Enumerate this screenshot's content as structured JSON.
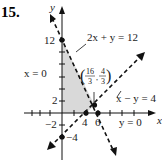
{
  "problem_number": "15.",
  "axes": {
    "x_label": "x",
    "y_label": "y",
    "y_ticks": [
      "12",
      "2",
      "−2",
      "−4"
    ],
    "x_ticks": [
      "4",
      "6"
    ]
  },
  "lines": [
    {
      "equation": "2x + y = 12",
      "style": "dashed"
    },
    {
      "equation": "x − y = 4",
      "style": "dashed"
    },
    {
      "equation": "x = 0",
      "style": "boundary"
    },
    {
      "equation": "y = 0",
      "style": "boundary"
    }
  ],
  "points": [
    {
      "label": "(0, 12)"
    },
    {
      "label": "(4, 0)"
    },
    {
      "label": "(6, 0)"
    },
    {
      "label": "(16/3, 4/3)",
      "num_x": "16",
      "den_x": "3",
      "num_y": "4",
      "den_y": "3"
    },
    {
      "label": "(0, −4)"
    }
  ],
  "region": {
    "description": "shaded feasible region bounded by x = 0, y = 0, 2x + y = 12, x − y = 4",
    "fill": "#d9d9d9"
  },
  "colors": {
    "ink": "#111111",
    "shade": "#d9d9d9"
  }
}
